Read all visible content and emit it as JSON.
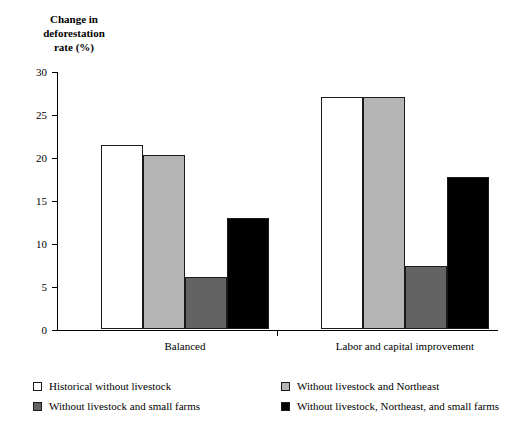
{
  "chart_data": {
    "type": "bar",
    "title": "",
    "xlabel": "",
    "ylabel": "Change in\ndeforestation\nrate (%)",
    "ylim": [
      0,
      30
    ],
    "yticks": [
      0,
      5,
      10,
      15,
      20,
      25,
      30
    ],
    "ytick_labels": [
      "0",
      "5",
      "10",
      "15",
      "20",
      "25",
      "30"
    ],
    "grid": false,
    "legend_position": "bottom",
    "categories": [
      "Balanced",
      "Labor and capital improvement"
    ],
    "series": [
      {
        "name": "Historical without livestock",
        "color": "#ffffff",
        "values": [
          21.4,
          27.0
        ]
      },
      {
        "name": "Without livestock and Northeast",
        "color": "#b5b5b5",
        "values": [
          20.2,
          27.0
        ]
      },
      {
        "name": "Without livestock and small farms",
        "color": "#636363",
        "values": [
          6.0,
          7.3
        ]
      },
      {
        "name": "Without livestock, Northeast, and small farms",
        "color": "#000000",
        "values": [
          12.9,
          17.7
        ]
      }
    ]
  }
}
